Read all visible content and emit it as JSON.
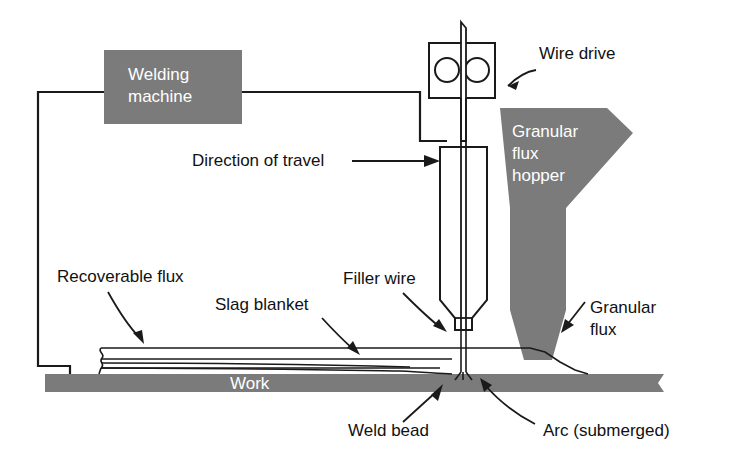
{
  "diagram": {
    "colors": {
      "fill_gray": "#7b7b7b",
      "line": "#1a1a1a",
      "background": "#ffffff",
      "label_on_gray": "#ffffff",
      "label_text": "#111111"
    },
    "blocks": [
      {
        "id": "welding-machine",
        "label_line1": "Welding",
        "label_line2": "machine",
        "fill": "#7b7b7b",
        "text_color": "#ffffff"
      },
      {
        "id": "granular-flux-hopper",
        "label_line1": "Granular",
        "label_line2": "flux",
        "label_line3": "hopper",
        "fill": "#7b7b7b",
        "text_color": "#ffffff"
      },
      {
        "id": "work",
        "label": "Work",
        "fill": "#7b7b7b",
        "text_color": "#ffffff"
      }
    ],
    "callouts": [
      {
        "id": "wire-drive",
        "label": "Wire drive"
      },
      {
        "id": "direction-of-travel",
        "label": "Direction of travel"
      },
      {
        "id": "recoverable-flux",
        "label": "Recoverable flux"
      },
      {
        "id": "slag-blanket",
        "label": "Slag blanket"
      },
      {
        "id": "filler-wire",
        "label": "Filler wire"
      },
      {
        "id": "granular-flux",
        "label_line1": "Granular",
        "label_line2": "flux"
      },
      {
        "id": "weld-bead",
        "label": "Weld bead"
      },
      {
        "id": "arc-submerged",
        "label": "Arc (submerged)"
      }
    ],
    "parts": [
      {
        "id": "wire-drive-rollers",
        "name": "wire-drive-rollers"
      },
      {
        "id": "welding-torch",
        "name": "welding-torch-body"
      },
      {
        "id": "electrode-wire",
        "name": "electrode-wire"
      },
      {
        "id": "ground-cable",
        "name": "ground-cable"
      },
      {
        "id": "power-cable",
        "name": "power-cable"
      },
      {
        "id": "flux-bed",
        "name": "flux-bed-layers"
      }
    ]
  }
}
